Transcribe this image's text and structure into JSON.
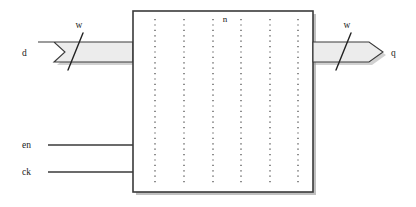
{
  "diagram": {
    "type": "register-block-diagram",
    "width": 416,
    "height": 207,
    "background_color": "#ffffff",
    "line_color": "#3a3a3a",
    "bus_fill_color": "#ececec",
    "shadow_color": "#7a7a7a",
    "block": {
      "name": "register-block",
      "x": 133,
      "y": 11,
      "width": 180,
      "height": 181,
      "fill": "#ffffff",
      "dotted_columns": 6,
      "dot_color": "#4a4a4a",
      "top_label": "n"
    },
    "ports": {
      "input_bus": {
        "label": "d",
        "width_label": "w",
        "shape": "chevron-tail-bus"
      },
      "output_bus": {
        "label": "q",
        "width_label": "w",
        "shape": "arrow-head-bus"
      },
      "control_lines": [
        {
          "label": "en"
        },
        {
          "label": "ck"
        }
      ]
    }
  }
}
